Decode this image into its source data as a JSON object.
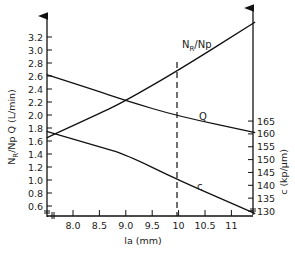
{
  "chart_data": {
    "type": "line",
    "title": "",
    "xlabel": "la (mm)",
    "ylabel_left": "N_R/Np  Q (L/min)",
    "ylabel_right": "c (kp/µm)",
    "x_ticks": [
      "8.0",
      "8.5",
      "9.0",
      "9.5",
      "10",
      "10.5",
      "11"
    ],
    "x_tick_values": [
      8.0,
      8.5,
      9.0,
      9.5,
      10.0,
      10.5,
      11.0
    ],
    "xlim": [
      7.5,
      11.45
    ],
    "y_left_ticks": [
      "0.6",
      "0.8",
      "1.0",
      "1.2",
      "1.4",
      "1.6",
      "1.8",
      "2.0",
      "2.2",
      "2.4",
      "2.6",
      "2.8",
      "3.0",
      "3.2"
    ],
    "y_left_tick_values": [
      0.6,
      0.8,
      1.0,
      1.2,
      1.4,
      1.6,
      1.8,
      2.0,
      2.2,
      2.4,
      2.6,
      2.8,
      3.0,
      3.2
    ],
    "ylim_left": [
      0.5,
      3.5
    ],
    "y_right_ticks": [
      "130",
      "135",
      "140",
      "145",
      "150",
      "155",
      "160",
      "165"
    ],
    "y_right_tick_values": [
      130,
      135,
      140,
      145,
      150,
      155,
      160,
      165
    ],
    "ylim_right": [
      129,
      166
    ],
    "grid": false,
    "legend": "inline curve labels",
    "series": [
      {
        "name": "N_R/Np",
        "axis": "left",
        "x": [
          7.5,
          8.5,
          9.0,
          10.0,
          11.45
        ],
        "y": [
          1.65,
          2.02,
          2.22,
          2.69,
          3.43
        ]
      },
      {
        "name": "Q",
        "axis": "left",
        "x": [
          7.5,
          8.5,
          9.0,
          10.0,
          11.45
        ],
        "y": [
          2.62,
          2.36,
          2.22,
          1.98,
          1.73
        ]
      },
      {
        "name": "c",
        "axis": "right",
        "x": [
          7.5,
          8.5,
          9.0,
          10.0,
          11.45
        ],
        "y": [
          161,
          155,
          152,
          142,
          129
        ]
      }
    ],
    "annotations": [
      {
        "type": "vertical-dashed-line",
        "x": 10.0,
        "note": "marks la = 10 mm"
      }
    ],
    "axis_break_marks": "broken axis symbol at origin of both axes"
  },
  "labels": {
    "curve_nr": "N",
    "curve_nr_sub": "R",
    "curve_nr_tail": "/Np",
    "curve_q": "Q",
    "curve_c": "c",
    "x_title": "la (mm)",
    "left_title_a": "N",
    "left_title_sub": "R",
    "left_title_b": "/Np  Q (L/min)",
    "right_title": "c (kp/µm)"
  }
}
